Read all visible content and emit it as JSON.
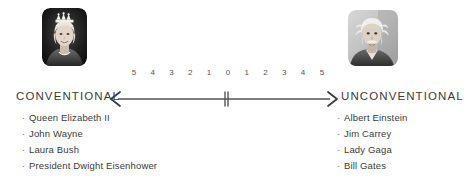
{
  "diagram": {
    "type": "bipolar-scale",
    "left_pole": {
      "heading": "CONVENTIONAL",
      "portrait_alt": "Queen Elizabeth II portrait",
      "examples": [
        "Queen Elizabeth II",
        "John Wayne",
        "Laura Bush",
        "President Dwight Eisenhower"
      ]
    },
    "right_pole": {
      "heading": "UNCONVENTIONAL",
      "portrait_alt": "Albert Einstein portrait",
      "examples": [
        "Albert Einstein",
        "Jim Carrey",
        "Lady Gaga",
        "Bill Gates"
      ]
    },
    "scale": {
      "ticks": [
        "5",
        "4",
        "3",
        "2",
        "1",
        "0",
        "1",
        "2",
        "3",
        "4",
        "5"
      ],
      "center_value": "0",
      "center_marker": "double-tick",
      "left_arrow": "chevron-left",
      "right_arrow": "chevron-right"
    },
    "bullet_glyph": "·",
    "colors": {
      "background": "#ffffff",
      "text": "#3b3b3b",
      "tick_text": "#555555",
      "axis_line": "#555555"
    }
  }
}
